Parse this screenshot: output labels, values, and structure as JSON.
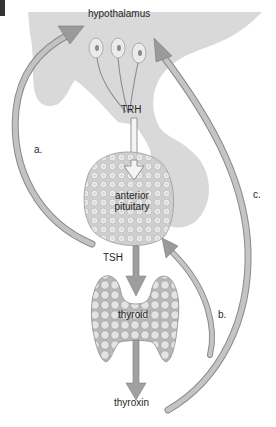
{
  "figure": {
    "type": "hormone feedback loop diagram",
    "labels": {
      "hypothalamus": "hypothalamus",
      "trh": "TRH",
      "anterior_pituitary_line1": "anterior",
      "anterior_pituitary_line2": "pituitary",
      "tsh": "TSH",
      "thyroid": "thyroid",
      "thyroxin": "thyroxin",
      "arrow_a": "a.",
      "arrow_b": "b.",
      "arrow_c": "c."
    },
    "colors": {
      "background": "#ffffff",
      "brain_region": "#d9d9d9",
      "arrow_fill": "#a6a6a6",
      "arrow_edge": "#7a7a7a",
      "gland_fill": "#c8c8c8",
      "gland_cell": "#ececec",
      "text": "#1f1f1f"
    }
  }
}
